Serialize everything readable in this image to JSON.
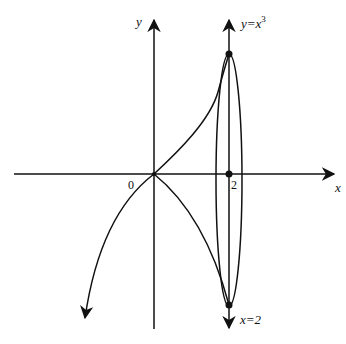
{
  "figure": {
    "axes": {
      "x_label": "x",
      "y_label": "y",
      "origin_label": "0",
      "tick_label_x": "2"
    },
    "annotations": {
      "curve_label_base": "y=x",
      "curve_label_exp": "3",
      "line_label": "x=2"
    },
    "colors": {
      "stroke": "#111111",
      "background": "#ffffff"
    }
  }
}
